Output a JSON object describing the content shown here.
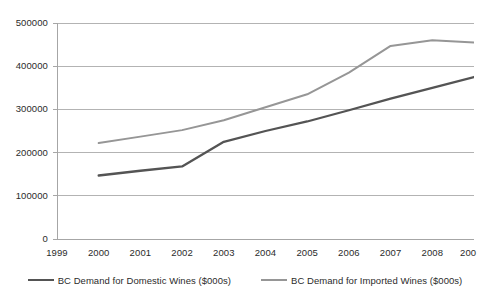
{
  "chart_data": {
    "type": "line",
    "title": "",
    "subtitle": "",
    "xlabel": "",
    "ylabel": "",
    "x": [
      1999,
      2000,
      2001,
      2002,
      2003,
      2004,
      2005,
      2006,
      2007,
      2008,
      2009
    ],
    "xtick_labels": [
      "1999",
      "2000",
      "2001",
      "2002",
      "2003",
      "2004",
      "2005",
      "2006",
      "2007",
      "2008",
      "200"
    ],
    "ytick_labels": [
      "0",
      "100000",
      "200000",
      "300000",
      "400000",
      "500000"
    ],
    "ytick_values": [
      0,
      100000,
      200000,
      300000,
      400000,
      500000
    ],
    "ylim": [
      0,
      500000
    ],
    "xlim": [
      1999,
      2009
    ],
    "grid": "horizontal",
    "legend_position": "bottom",
    "series": [
      {
        "name": "BC Demand for Domestic Wines ($000s)",
        "color": "#545454",
        "x": [
          2000,
          2001,
          2002,
          2003,
          2004,
          2005,
          2006,
          2007,
          2008,
          2009
        ],
        "values": [
          147000,
          158000,
          168000,
          225000,
          250000,
          272000,
          298000,
          325000,
          350000,
          375000
        ]
      },
      {
        "name": "BC Demand for Imported Wines ($000s)",
        "color": "#969696",
        "x": [
          2000,
          2001,
          2002,
          2003,
          2004,
          2005,
          2006,
          2007,
          2008,
          2009
        ],
        "values": [
          222000,
          237000,
          252000,
          275000,
          305000,
          335000,
          385000,
          447000,
          460000,
          455000
        ]
      }
    ]
  },
  "legend": {
    "items": [
      {
        "label": "BC Demand for Domestic Wines ($000s)",
        "color": "#545454"
      },
      {
        "label": "BC Demand for Imported Wines ($000s)",
        "color": "#969696"
      }
    ]
  },
  "axes": {
    "y_labels": [
      "500000",
      "400000",
      "300000",
      "200000",
      "100000",
      "0"
    ],
    "x_labels": [
      "1999",
      "2000",
      "2001",
      "2002",
      "2003",
      "2004",
      "2005",
      "2006",
      "2007",
      "2008",
      "200"
    ]
  },
  "style": {
    "grid_color": "#b3b3b3",
    "axis_color": "#a6a6a6",
    "background": "#ffffff",
    "text_color": "#2b2b2b"
  }
}
